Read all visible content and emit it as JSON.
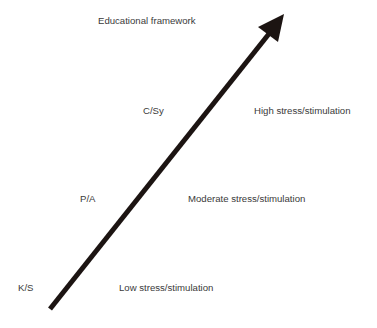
{
  "diagram": {
    "title": "Educational framework",
    "arrow_color": "#1c1412",
    "text_color": "#3a3a3a",
    "levels": [
      {
        "code": "K/S",
        "description": "Low stress/stimulation"
      },
      {
        "code": "P/A",
        "description": "Moderate stress/stimulation"
      },
      {
        "code": "C/Sy",
        "description": "High stress/stimulation"
      }
    ]
  }
}
